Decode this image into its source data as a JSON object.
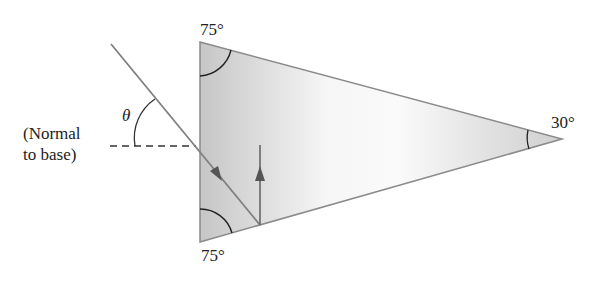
{
  "diagram": {
    "type": "prism-refraction",
    "labels": {
      "top_angle": "75°",
      "bottom_angle": "75°",
      "apex_angle": "30°",
      "theta": "θ",
      "normal_line1": "(Normal",
      "normal_line2": "to base)"
    },
    "prism": {
      "vertices": [
        [
          200,
          42
        ],
        [
          200,
          242
        ],
        [
          562,
          139
        ]
      ],
      "fill_dark": "#c9c9c9",
      "fill_light": "#f4f4f4",
      "stroke": "#8a8a8a"
    },
    "rays": {
      "incident": {
        "from": [
          111,
          44
        ],
        "to": [
          260,
          225
        ]
      },
      "reflected_vertical": {
        "from": [
          260,
          225
        ],
        "to": [
          260,
          145
        ]
      }
    },
    "normal_dashed": {
      "from": [
        110,
        146
      ],
      "to": [
        196,
        146
      ]
    },
    "colors": {
      "ray": "#7a7a7a",
      "arc": "#222222",
      "arrow": "#555555"
    }
  }
}
